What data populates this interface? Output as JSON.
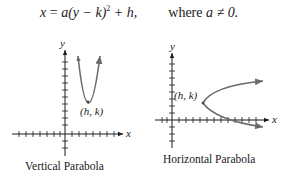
{
  "equation": {
    "lhs": "x",
    "rhs_a": "a",
    "rhs_mid": "(y − k)",
    "rhs_exp": "2",
    "rhs_tail": " + h,",
    "condition_prefix": "where ",
    "condition": "a ≠ 0."
  },
  "diagrams": [
    {
      "caption": "Vertical Parabola",
      "vertex_label": "(h, k)",
      "x_axis_label": "x",
      "y_axis_label": "y",
      "opens": "up"
    },
    {
      "caption": "Horizontal Parabola",
      "vertex_label": "(h, k)",
      "x_axis_label": "x",
      "y_axis_label": "y",
      "opens": "right"
    }
  ],
  "colors": {
    "axis": "#1a1a1a",
    "curve": "#6b6b6b"
  }
}
